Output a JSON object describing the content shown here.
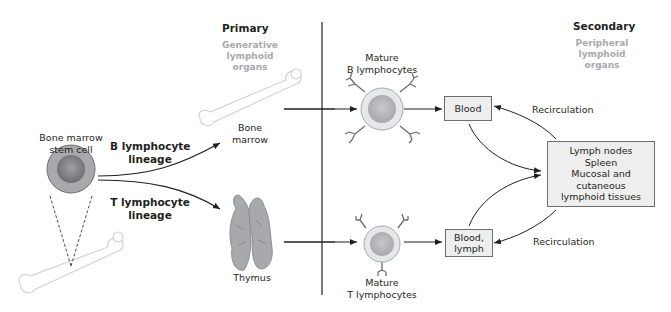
{
  "sections": {
    "primary": {
      "title": "Primary",
      "subtitle_line1": "Generative",
      "subtitle_line2": "lymphoid organs"
    },
    "secondary": {
      "title": "Secondary",
      "subtitle_line1": "Peripheral",
      "subtitle_line2": "lymphoid organs"
    }
  },
  "stem_cell": {
    "line1": "Bone marrow",
    "line2": "stem cell"
  },
  "lineages": {
    "b": {
      "line1": "B lymphocyte",
      "line2": "lineage"
    },
    "t": {
      "line1": "T lymphocyte",
      "line2": "lineage"
    }
  },
  "organs": {
    "bone_marrow": {
      "line1": "Bone",
      "line2": "marrow"
    },
    "thymus": {
      "label": "Thymus"
    }
  },
  "mature_cells": {
    "b": {
      "line1": "Mature",
      "line2": "B lymphocytes"
    },
    "t": {
      "line1": "Mature",
      "line2": "T lymphocytes"
    }
  },
  "boxes": {
    "blood": {
      "label": "Blood"
    },
    "blood_lymph": {
      "line1": "Blood,",
      "line2": "lymph"
    },
    "secondary_organs": {
      "line1": "Lymph nodes",
      "line2": "Spleen",
      "line3": "Mucosal and cutaneous",
      "line4": "lymphoid tissues"
    }
  },
  "recirculation": {
    "top": "Recirculation",
    "bottom": "Recirculation"
  },
  "colors": {
    "text": "#231f20",
    "subtitle": "#a7a9ac",
    "box_fill": "#eeeeee",
    "cell_outer": "#bcbec0",
    "cell_nucleus": "#939598",
    "divider": "#231f20"
  }
}
